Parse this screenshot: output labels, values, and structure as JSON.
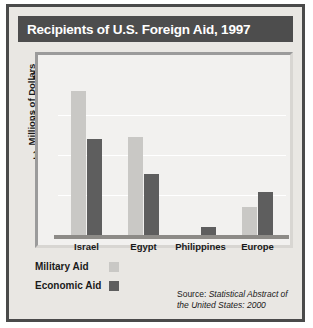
{
  "title": "Recipients of U.S. Foreign Aid, 1997",
  "source": {
    "prefix": "Source: ",
    "text": "Statistical Abstract of the United States: 2000"
  },
  "legend": {
    "military_label": "Military Aid",
    "economic_label": "Economic Aid"
  },
  "colors": {
    "military": "#c9c8c5",
    "economic": "#5e5e5e",
    "title_bar": "#4d4d4d",
    "frame": "#4a4a4a",
    "background": "#e9e7e3",
    "plot_background": "#f2f1ef"
  },
  "chart_data": {
    "type": "bar",
    "title": "Recipients of U.S. Foreign Aid, 1997",
    "xlabel": "",
    "ylabel": "Millions of Dollars",
    "categories": [
      "Israel",
      "Egypt",
      "Philippines",
      "Europe"
    ],
    "series": [
      {
        "name": "Military Aid",
        "values": [
          1800,
          1230,
          0,
          350
        ]
      },
      {
        "name": "Economic Aid",
        "values": [
          1200,
          760,
          100,
          540
        ]
      }
    ],
    "ylim": [
      0,
      2000
    ],
    "yticks": [
      0,
      500,
      1000,
      1500,
      2000
    ],
    "ytick_labels": [
      "0",
      "500",
      "1,000",
      "1,500",
      "2,000"
    ],
    "grid": true,
    "legend_position": "bottom-left"
  }
}
